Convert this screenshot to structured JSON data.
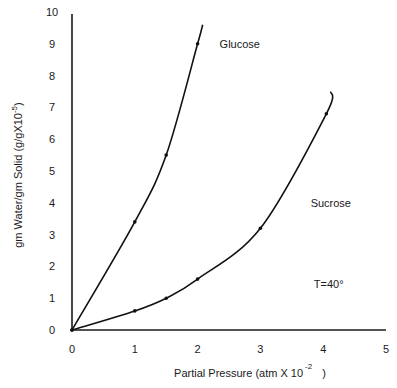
{
  "chart_data": {
    "type": "line",
    "title": "",
    "xlabel": "Partial Pressure (atm X 10",
    "xlabel_exponent": "-2",
    "xlabel_suffix": ")",
    "ylabel": "gm Water/gm Solid (g/gX10",
    "ylabel_exponent": "-5",
    "ylabel_suffix": ")",
    "xlim": [
      0,
      5
    ],
    "ylim": [
      0,
      10
    ],
    "x_ticks": [
      0,
      1,
      2,
      3,
      4,
      5
    ],
    "y_ticks": [
      0,
      1,
      2,
      3,
      4,
      5,
      6,
      7,
      8,
      9,
      10
    ],
    "grid": false,
    "series": [
      {
        "name": "Glucose",
        "points": [
          [
            0,
            0
          ],
          [
            1,
            3.4
          ],
          [
            1.5,
            5.5
          ],
          [
            2,
            9.0
          ]
        ],
        "curve_extends_to": [
          2.08,
          9.6
        ]
      },
      {
        "name": "Sucrose",
        "points": [
          [
            0,
            0
          ],
          [
            1,
            0.6
          ],
          [
            1.5,
            1.0
          ],
          [
            2,
            1.6
          ],
          [
            3,
            3.2
          ],
          [
            4.05,
            6.8
          ]
        ],
        "curve_extends_to": [
          4.12,
          7.5
        ]
      }
    ],
    "annotations": [
      {
        "text": "Glucose",
        "x": 2.35,
        "y": 9.0
      },
      {
        "text": "Sucrose",
        "x": 3.8,
        "y": 4.0
      },
      {
        "text": "T=40°",
        "x": 3.85,
        "y": 1.45
      }
    ]
  }
}
